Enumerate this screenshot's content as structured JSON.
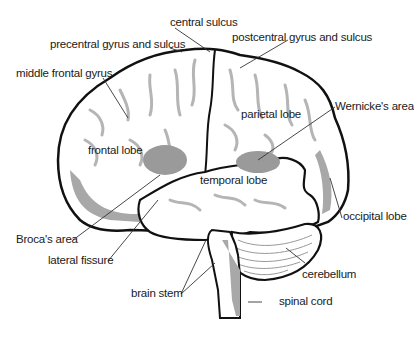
{
  "diagram": {
    "type": "labeled anatomical illustration",
    "colors": {
      "outline": "#111111",
      "fill": "#ffffff",
      "shade": "#a8a8a8",
      "area_highlight": "#9a9a9a",
      "leader": "#333333"
    },
    "labels": {
      "central_sulcus": "central sulcus",
      "precentral": "precentral gyrus and sulcus",
      "postcentral": "postcentral gyrus and sulcus",
      "middle_frontal": "middle frontal gyrus",
      "parietal": "parietal lobe",
      "wernicke": "Wernicke's area",
      "frontal": "frontal lobe",
      "temporal": "temporal lobe",
      "broca": "Broca's area",
      "occipital": "occipital lobe",
      "lateral_fissure": "lateral fissure",
      "brain_stem": "brain stem",
      "cerebellum": "cerebellum",
      "spinal_cord": "spinal cord"
    }
  }
}
